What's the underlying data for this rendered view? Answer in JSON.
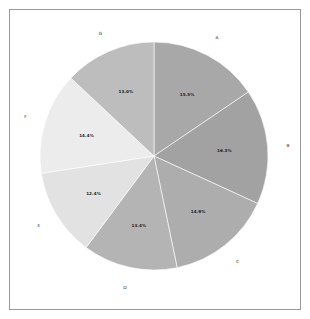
{
  "figure": {
    "background_color": "#ffffff",
    "frame_color": "#9a9a9a",
    "label_text_color": "#1a1a1a",
    "category_text_color": "#2a2a2a"
  },
  "chart_data": {
    "type": "pie",
    "title": "",
    "xlabel": "",
    "ylabel": "",
    "legend_position": "none",
    "grid": false,
    "start_angle_deg": 90,
    "direction": "clockwise",
    "center": {
      "x": 154,
      "y": 156
    },
    "radius": 114,
    "label_radius_fraction": 0.62,
    "category_label_radius_fraction": 1.18,
    "categories": [
      "A",
      "B",
      "C",
      "D",
      "E",
      "F",
      "G"
    ],
    "values": [
      15.5,
      16.3,
      14.9,
      13.4,
      12.4,
      14.4,
      13.0
    ],
    "percent_labels": [
      "15.5%",
      "16.3%",
      "14.9%",
      "13.4%",
      "12.4%",
      "14.4%",
      "13.0%"
    ],
    "colors": [
      "#a8a8a8",
      "#a2a2a2",
      "#adadad",
      "#b4b4b4",
      "#e2e2e2",
      "#ececec",
      "#bdbdbd"
    ],
    "slices": [
      {
        "name": "A",
        "value": 15.5,
        "percent_label": "15.5%",
        "color": "#a8a8a8"
      },
      {
        "name": "B",
        "value": 16.3,
        "percent_label": "16.3%",
        "color": "#a2a2a2"
      },
      {
        "name": "C",
        "value": 14.9,
        "percent_label": "14.9%",
        "color": "#adadad"
      },
      {
        "name": "D",
        "value": 13.4,
        "percent_label": "13.4%",
        "color": "#b4b4b4"
      },
      {
        "name": "E",
        "value": 12.4,
        "percent_label": "12.4%",
        "color": "#e2e2e2"
      },
      {
        "name": "F",
        "value": 14.4,
        "percent_label": "14.4%",
        "color": "#ececec"
      },
      {
        "name": "G",
        "value": 13.0,
        "percent_label": "13.0%",
        "color": "#bdbdbd"
      }
    ]
  }
}
